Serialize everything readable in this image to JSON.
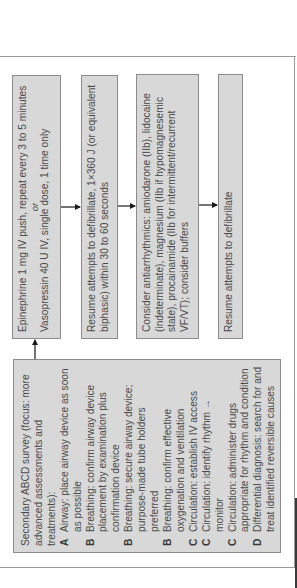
{
  "colors": {
    "box_fill": "#d8d8d8",
    "box_border": "#8c8c8c",
    "text": "#4a4a4a",
    "arrow": "#1a1a1a"
  },
  "orientation": "rotated-90-ccw",
  "boxes": {
    "epinephrine": {
      "line1": "Epinephrine 1 mg IV push, repeat every 3 to 5 minutes",
      "or": "or",
      "line2": "Vasopressin 40 U IV, single dose, 1 time only"
    },
    "resume1": {
      "text": "Resume attempts to defibrillate, 1×360 J (or equivalent biphasic) within 30 to 60 seconds"
    },
    "antiarrhythmics": {
      "text": "Consider antiarrhythmics: amiodarone (IIb), lidocaine (indeterminate), magnesium (IIb if hypomagnesemic state), procainamide (IIb for intermittent/recurrent VF/VT); consider buffers"
    },
    "resume2": {
      "text": "Resume attempts to defibrillate"
    }
  },
  "survey": {
    "header": "Secondary ABCD survey (focus: more advanced assessments and treatments):",
    "items": [
      {
        "letter": "A",
        "text": "Airway: place airway device as soon as possible"
      },
      {
        "letter": "B",
        "text": "Breathing: confirm airway device placement by examination plus confirmation device"
      },
      {
        "letter": "B",
        "text": "Breathing: secure airway device; purpose-made tube holders preferred"
      },
      {
        "letter": "B",
        "text": "Breathing: confirm effective oxygenation and ventilation"
      },
      {
        "letter": "C",
        "text": "Circulation: establish IV access"
      },
      {
        "letter": "C",
        "text": "Circulation: identify rhythm → monitor"
      },
      {
        "letter": "C",
        "text": "Circulation: administer drugs appropriate for rhythm and condition"
      },
      {
        "letter": "D",
        "text": "Differential diagnosis: search for and treat identified reversible causes"
      }
    ]
  }
}
